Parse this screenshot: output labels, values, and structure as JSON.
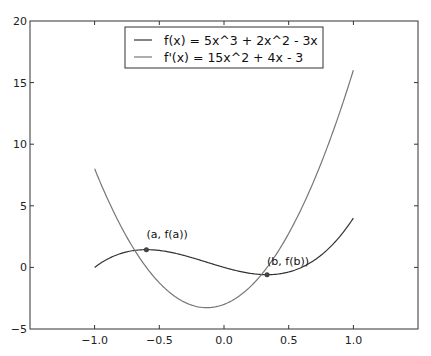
{
  "chart_data": {
    "type": "line",
    "title": "",
    "xlabel": "",
    "ylabel": "",
    "xlim": [
      -1.5,
      1.5
    ],
    "ylim": [
      -5,
      20
    ],
    "grid": false,
    "legend_position": "upper center",
    "x_ticks": [
      -1.0,
      -0.5,
      0.0,
      0.5,
      1.0
    ],
    "x_tick_labels": [
      "−1.0",
      "−0.5",
      "0.0",
      "0.5",
      "1.0"
    ],
    "y_ticks": [
      -5,
      0,
      5,
      10,
      15,
      20
    ],
    "y_tick_labels": [
      "−5",
      "0",
      "5",
      "10",
      "15",
      "20"
    ],
    "series": [
      {
        "name": "f(x) = 5x^3 + 2x^2 - 3x",
        "color": "#333333",
        "x": [
          -1.0,
          -0.8,
          -0.6,
          -0.4,
          -0.2,
          0.0,
          0.2,
          0.4,
          0.6,
          0.8,
          1.0
        ],
        "values": [
          0.0,
          1.12,
          1.44,
          1.2,
          0.64,
          0.0,
          -0.48,
          -0.56,
          0.0,
          1.44,
          4.0
        ]
      },
      {
        "name": "f'(x) = 15x^2 + 4x - 3",
        "color": "#777777",
        "x": [
          -1.0,
          -0.8,
          -0.6,
          -0.4,
          -0.2,
          0.0,
          0.2,
          0.4,
          0.6,
          0.8,
          1.0
        ],
        "values": [
          8.0,
          3.4,
          -0.0,
          -2.2,
          -3.2,
          -3.0,
          -1.6,
          0.0,
          4.8,
          9.8,
          16.0
        ]
      }
    ],
    "annotations": [
      {
        "text": "(a, f(a))",
        "x": -0.6,
        "y": 1.44
      },
      {
        "text": "(b, f(b))",
        "x": 0.333,
        "y": -0.593
      }
    ]
  },
  "legend": {
    "items": [
      {
        "label": "f(x) = 5x^3 + 2x^2 - 3x",
        "color": "#333333"
      },
      {
        "label": "f'(x) = 15x^2 + 4x - 3",
        "color": "#777777"
      }
    ]
  },
  "axes": {
    "x_labels": [
      "−1.0",
      "−0.5",
      "0.0",
      "0.5",
      "1.0"
    ],
    "y_labels": [
      "20",
      "15",
      "10",
      "5",
      "0",
      "−5"
    ]
  },
  "annotations": {
    "a_label": "(a, f(a))",
    "b_label": "(b, f(b))"
  }
}
